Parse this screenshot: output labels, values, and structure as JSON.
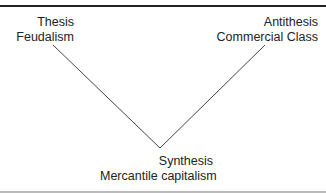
{
  "diagram": {
    "thesis": {
      "role": "Thesis",
      "name": "Feudalism"
    },
    "antithesis": {
      "role": "Antithesis",
      "name": "Commercial Class"
    },
    "synthesis": {
      "role": "Synthesis",
      "name": "Mercantile capitalism"
    },
    "line_color": "#444444"
  }
}
